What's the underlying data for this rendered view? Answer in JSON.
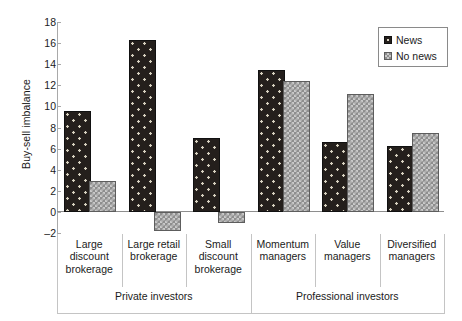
{
  "chart_data": {
    "type": "bar",
    "title": "",
    "xlabel": "",
    "ylabel": "Buy-sell imbalance",
    "ylim": [
      -2,
      18
    ],
    "yticks": [
      -2,
      0,
      2,
      4,
      6,
      8,
      10,
      12,
      14,
      16,
      18
    ],
    "grid": false,
    "legend_position": "top-right",
    "categories": [
      "Large discount brokerage",
      "Large retail brokerage",
      "Small discount brokerage",
      "Momentum managers",
      "Value managers",
      "Diversified managers"
    ],
    "category_lines": [
      [
        "Large",
        "discount",
        "brokerage"
      ],
      [
        "Large retail",
        "brokerage"
      ],
      [
        "Small",
        "discount",
        "brokerage"
      ],
      [
        "Momentum",
        "managers"
      ],
      [
        "Value",
        "managers"
      ],
      [
        "Diversified",
        "managers"
      ]
    ],
    "groups": [
      {
        "label": "Private investors",
        "categories": 3
      },
      {
        "label": "Professional investors",
        "categories": 3
      }
    ],
    "series": [
      {
        "name": "News",
        "color": "#241f1c",
        "values": [
          9.4,
          16.1,
          6.8,
          13.3,
          6.4,
          6.1
        ]
      },
      {
        "name": "No news",
        "color": "#8e8e8e",
        "values": [
          2.7,
          -1.6,
          -0.9,
          12.2,
          11.0,
          7.3
        ]
      }
    ]
  }
}
